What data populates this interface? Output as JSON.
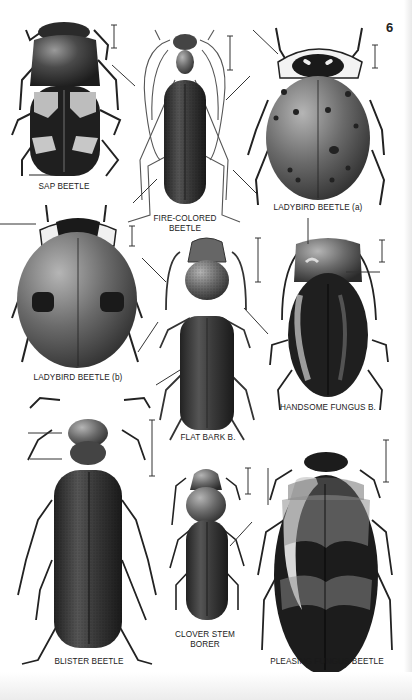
{
  "page": {
    "number": "6",
    "type": "illustrated field guide plate"
  },
  "specimens": [
    {
      "id": "sap-beetle",
      "label": "SAP BEETLE"
    },
    {
      "id": "fire-colored-beetle",
      "label_line1": "FIRE-COLORED",
      "label_line2": "BEETLE"
    },
    {
      "id": "ladybird-beetle-a",
      "label": "LADYBIRD BEETLE (a)"
    },
    {
      "id": "ladybird-beetle-b",
      "label": "LADYBIRD BEETLE (b)"
    },
    {
      "id": "flat-bark-beetle",
      "label": "FLAT BARK B."
    },
    {
      "id": "handsome-fungus-beetle",
      "label": "HANDSOME FUNGUS B."
    },
    {
      "id": "blister-beetle",
      "label": "BLISTER BEETLE"
    },
    {
      "id": "clover-stem-borer",
      "label_line1": "CLOVER STEM",
      "label_line2": "BORER"
    },
    {
      "id": "pleasing-fungus-beetle",
      "label": "PLEASING FUNGUS BEETLE"
    }
  ],
  "colors": {
    "ink": "#1a1a1a",
    "shell_dark": "#2a2a2a",
    "shell_mid": "#555555",
    "highlight": "#cfcfcf"
  }
}
